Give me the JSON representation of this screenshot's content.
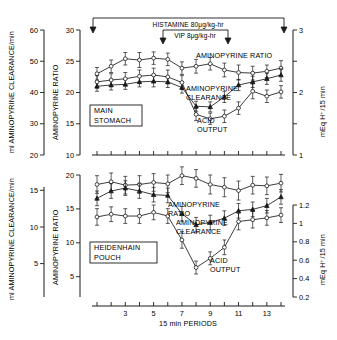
{
  "figure": {
    "xlabel": "15 min PERIODS",
    "xticks": [
      "3",
      "5",
      "7",
      "9",
      "11",
      "13"
    ],
    "xtick_periods": [
      3,
      5,
      7,
      9,
      11,
      13
    ],
    "x_periods": [
      1,
      2,
      3,
      4,
      5,
      6,
      7,
      8,
      9,
      10,
      11,
      12,
      13,
      14
    ],
    "axis_titles": {
      "clearance": "ml AMINOPYRINE CLEARANCE/min",
      "ratio": "AMINOPYRINE RATIO",
      "acid": "mEq H⁺/15 min"
    },
    "annotations": {
      "histamine": "HISTAMINE 80μg/kg-hr",
      "vip": "VIP 8μg/kg-hr",
      "aminopyrine_ratio": "AMINOPYRINE RATIO",
      "aminopyrine_ratio_l1": "AMINOPYRINE",
      "aminopyrine_ratio_l2": "RATIO",
      "aminopyrine_clearance_l1": "AMINOPYRINE",
      "aminopyrine_clearance_l2": "CLEARANCE",
      "acid_output_l1": "ACID",
      "acid_output_l2": "OUTPUT",
      "main_stomach_l1": "MAIN",
      "main_stomach_l2": "STOMACH",
      "heidenhain_l1": "HEIDENHAIN",
      "heidenhain_l2": "POUCH"
    }
  },
  "chart_data": [
    {
      "type": "line",
      "panel": "MAIN STOMACH",
      "title": "MAIN STOMACH",
      "xlabel": "15 min PERIODS",
      "x": [
        1,
        2,
        3,
        4,
        5,
        6,
        7,
        8,
        9,
        10,
        11,
        12,
        13,
        14
      ],
      "xlim": [
        0.5,
        14.5
      ],
      "grid": false,
      "legend": "inline-annotations",
      "axes": {
        "clearance": {
          "label": "ml AMINOPYRINE CLEARANCE/min",
          "ticks": [
            20,
            30,
            40,
            50,
            60
          ],
          "lim": [
            20,
            60
          ],
          "side": "left-outer"
        },
        "ratio": {
          "label": "AMINOPYRINE RATIO",
          "ticks": [
            10,
            15,
            20,
            25,
            30
          ],
          "lim": [
            10,
            30
          ],
          "side": "left-inner"
        },
        "acid": {
          "label": "mEq H⁺/15 min",
          "ticks": [
            1,
            2,
            3
          ],
          "lim": [
            1,
            3
          ],
          "side": "right"
        }
      },
      "series": [
        {
          "name": "AMINOPYRINE RATIO",
          "axis": "ratio",
          "marker": "open-circle",
          "values": [
            23.0,
            24.2,
            25.4,
            25.2,
            25.5,
            25.3,
            23.9,
            24.2,
            24.6,
            23.6,
            23.2,
            23.1,
            23.4,
            23.9
          ],
          "errors": [
            1.0,
            1.0,
            1.0,
            1.2,
            1.0,
            1.0,
            1.0,
            1.1,
            1.0,
            1.1,
            1.2,
            1.1,
            1.0,
            1.2
          ]
        },
        {
          "name": "AMINOPYRINE CLEARANCE",
          "axis": "clearance",
          "marker": "filled-triangle",
          "values": [
            42.0,
            42.4,
            42.6,
            43.4,
            43.6,
            43.4,
            41.6,
            35.6,
            35.4,
            38.6,
            42.4,
            43.4,
            44.4,
            45.6
          ],
          "errors": [
            1.6,
            1.6,
            1.6,
            1.6,
            1.8,
            1.8,
            1.8,
            1.6,
            1.6,
            1.8,
            1.8,
            1.8,
            1.8,
            2.0
          ]
        },
        {
          "name": "ACID OUTPUT",
          "axis": "acid",
          "marker": "open-circle",
          "values": [
            2.17,
            2.2,
            2.22,
            2.26,
            2.28,
            2.25,
            2.16,
            1.65,
            1.58,
            1.62,
            1.75,
            2.02,
            1.94,
            2.01
          ],
          "errors": [
            0.1,
            0.1,
            0.1,
            0.1,
            0.11,
            0.11,
            0.11,
            0.1,
            0.09,
            0.1,
            0.1,
            0.12,
            0.1,
            0.1
          ]
        }
      ],
      "treatments": [
        {
          "label": "HISTAMINE 80μg/kg-hr",
          "from": 1,
          "to": 14
        },
        {
          "label": "VIP 8μg/kg-hr",
          "from": 7,
          "to": 10
        }
      ]
    },
    {
      "type": "line",
      "panel": "HEIDENHAIN POUCH",
      "title": "HEIDENHAIN POUCH",
      "xlabel": "15 min PERIODS",
      "x": [
        1,
        2,
        3,
        4,
        5,
        6,
        7,
        8,
        9,
        10,
        11,
        12,
        13,
        14
      ],
      "xlim": [
        0.5,
        14.5
      ],
      "grid": false,
      "legend": "inline-annotations",
      "axes": {
        "clearance": {
          "label": "ml AMINOPYRINE CLEARANCE/min",
          "ticks": [
            5,
            10,
            15
          ],
          "lim": [
            2,
            17
          ],
          "side": "left-outer"
        },
        "ratio": {
          "label": "AMINOPYRINE RATIO",
          "ticks": [
            5,
            10,
            15,
            20
          ],
          "lim": [
            2,
            20
          ],
          "side": "left-inner"
        },
        "acid": {
          "label": "mEq H⁺/15 min",
          "ticks": [
            0.2,
            0.4,
            0.6,
            0.8,
            1.0,
            1.2
          ],
          "lim": [
            0.05,
            1.3
          ],
          "side": "right"
        }
      },
      "series": [
        {
          "name": "AMINOPYRINE RATIO",
          "axis": "ratio",
          "marker": "open-circle",
          "values": [
            18.6,
            19.0,
            18.5,
            18.6,
            18.9,
            18.7,
            19.9,
            19.5,
            18.6,
            18.2,
            17.7,
            18.5,
            18.4,
            18.8
          ],
          "errors": [
            1.3,
            1.3,
            1.3,
            1.3,
            1.3,
            1.3,
            1.3,
            1.3,
            1.4,
            1.4,
            1.4,
            1.3,
            1.3,
            1.3
          ]
        },
        {
          "name": "AMINOPYRINE CLEARANCE",
          "axis": "clearance",
          "marker": "filled-triangle",
          "values": [
            13.9,
            14.9,
            15.3,
            14.9,
            14.4,
            14.3,
            11.8,
            10.3,
            10.6,
            11.2,
            12.2,
            12.4,
            12.9,
            14.1
          ],
          "errors": [
            1.0,
            1.0,
            1.0,
            1.0,
            1.0,
            1.0,
            1.0,
            1.0,
            1.0,
            1.0,
            1.0,
            1.0,
            1.0,
            1.0
          ]
        },
        {
          "name": "ACID OUTPUT",
          "axis": "acid",
          "marker": "open-circle",
          "values": [
            1.07,
            1.1,
            1.08,
            1.08,
            1.12,
            1.08,
            0.82,
            0.52,
            0.62,
            0.74,
            1.02,
            1.04,
            1.06,
            1.09
          ],
          "errors": [
            0.09,
            0.08,
            0.08,
            0.08,
            0.08,
            0.08,
            0.09,
            0.07,
            0.07,
            0.08,
            0.09,
            0.09,
            0.08,
            0.08
          ]
        }
      ]
    }
  ]
}
